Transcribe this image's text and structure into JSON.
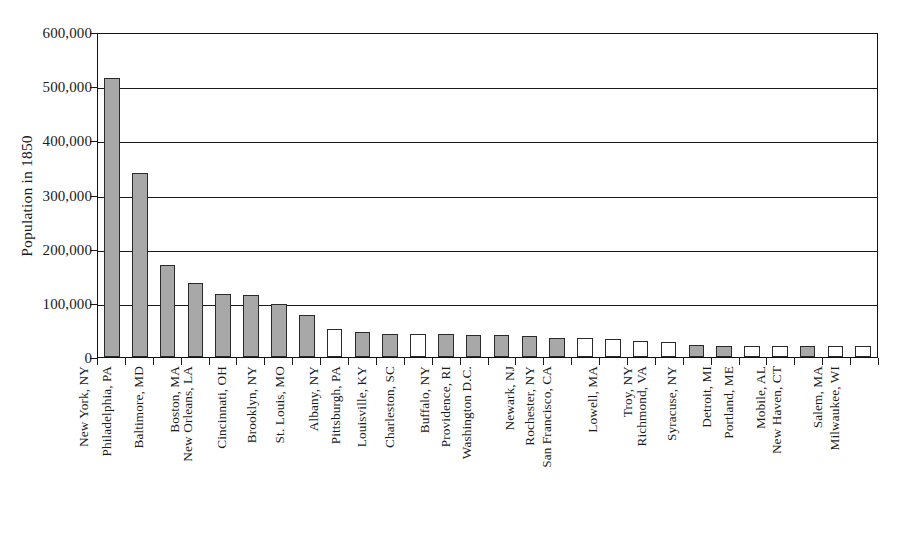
{
  "chart_data": {
    "type": "bar",
    "title": "",
    "xlabel": "",
    "ylabel": "Population in 1850",
    "ylim": [
      0,
      600000
    ],
    "ytick_labels": [
      "0",
      "100,000",
      "200,000",
      "300,000",
      "400,000",
      "500,000",
      "600,000"
    ],
    "ytick_values": [
      0,
      100000,
      200000,
      300000,
      400000,
      500000,
      600000
    ],
    "grid": "horizontal",
    "legend": "none",
    "categories": [
      "New York, NY",
      "Philadelphia, PA",
      "Baltimore, MD",
      "Boston, MA",
      "New Orleans, LA",
      "Cincinnati, OH",
      "Brooklyn, NY",
      "St. Louis, MO",
      "Albany, NY",
      "Pittsburgh, PA",
      "Louisville, KY",
      "Charleston, SC",
      "Buffalo, NY",
      "Providence, RI",
      "Washington D.C.",
      "Newark, NJ",
      "Rochester, NY",
      "San Francisco, CA",
      "Lowell, MA",
      "Troy, NY",
      "Richmond, VA",
      "Syracuse, NY",
      "Detroit, MI",
      "Portland, ME",
      "Mobile, AL",
      "New Haven, CT",
      "Salem, MA",
      "Milwaukee, WI"
    ],
    "values": [
      515000,
      340000,
      169000,
      137000,
      116000,
      115000,
      97000,
      78000,
      51000,
      47000,
      43000,
      43000,
      42000,
      41000,
      40000,
      39000,
      36000,
      35000,
      33000,
      29000,
      28000,
      22000,
      21000,
      21000,
      20000,
      20000,
      20000,
      20000
    ],
    "bar_fills": [
      "gray",
      "gray",
      "gray",
      "gray",
      "gray",
      "gray",
      "gray",
      "gray",
      "white",
      "gray",
      "gray",
      "white",
      "gray",
      "gray",
      "gray",
      "gray",
      "gray",
      "white",
      "white",
      "white",
      "white",
      "gray",
      "gray",
      "white",
      "white",
      "gray",
      "white",
      "white"
    ],
    "colors": {
      "bar_gray": "#a8a8a8",
      "bar_white": "#ffffff",
      "bar_edge": "#2a2a2a",
      "axis": "#111111",
      "text": "#1a1a1a"
    }
  }
}
